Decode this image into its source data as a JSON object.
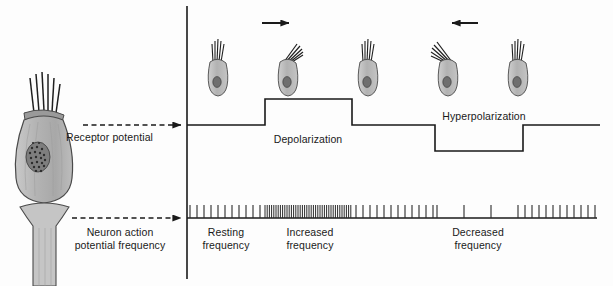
{
  "figure": {
    "type": "diagram",
    "width": 613,
    "height": 286,
    "background_color": "#fdfdfd",
    "line_color": "#1a1a1a"
  },
  "labels": {
    "receptor_potential": "Receptor potential",
    "neuron_action_line1": "Neuron action",
    "neuron_action_line2": "potential frequency",
    "depolarization": "Depolarization",
    "hyperpolarization": "Hyperpolarization",
    "resting_line1": "Resting",
    "resting_line2": "frequency",
    "increased_line1": "Increased",
    "increased_line2": "frequency",
    "decreased_line1": "Decreased",
    "decreased_line2": "frequency"
  },
  "icons": {
    "arrow_right": "arrow-right-icon",
    "arrow_left": "arrow-left-icon",
    "dashed_pointer_upper": "dashed-arrow-icon",
    "dashed_pointer_lower": "dashed-arrow-icon",
    "hair_cell": "hair-cell-icon",
    "sensory_neuron": "sensory-neuron-icon"
  },
  "hair_cells": [
    {
      "name": "hair-cell-upright-1",
      "bend": "none",
      "x": 218,
      "y": 62,
      "label": "upright"
    },
    {
      "name": "hair-cell-bent-right",
      "bend": "right",
      "x": 288,
      "y": 62,
      "label": "bent toward kinocilium"
    },
    {
      "name": "hair-cell-upright-2",
      "bend": "none",
      "x": 368,
      "y": 62,
      "label": "upright"
    },
    {
      "name": "hair-cell-bent-left",
      "bend": "left",
      "x": 448,
      "y": 62,
      "label": "bent away from kinocilium"
    },
    {
      "name": "hair-cell-upright-3",
      "bend": "none",
      "x": 518,
      "y": 62,
      "label": "upright"
    }
  ],
  "chart_data": {
    "type": "line",
    "title": "Receptor potential",
    "xlabel": "",
    "ylabel": "Receptor potential",
    "axis_origin_x": 187,
    "baseline_y": 125,
    "segments": [
      {
        "phase": "resting",
        "x_start": 187,
        "x_end": 265,
        "level": "baseline"
      },
      {
        "phase": "depolarization",
        "x_start": 265,
        "x_end": 352,
        "level": "above"
      },
      {
        "phase": "resting",
        "x_start": 352,
        "x_end": 435,
        "level": "baseline"
      },
      {
        "phase": "hyperpolarization",
        "x_start": 435,
        "x_end": 523,
        "level": "below"
      },
      {
        "phase": "resting",
        "x_start": 523,
        "x_end": 600,
        "level": "baseline"
      }
    ],
    "depolarization_amplitude_px": 26,
    "hyperpolarization_amplitude_px": 26
  },
  "spike_train": {
    "type": "raster",
    "baseline_y": 218,
    "x_start": 190,
    "x_end": 595,
    "tick_height": 13,
    "regions": [
      {
        "phase": "resting",
        "label": "Resting frequency",
        "x_start": 190,
        "x_end": 263,
        "interval_px": 7.0
      },
      {
        "phase": "increased",
        "label": "Increased frequency",
        "x_start": 265,
        "x_end": 352,
        "interval_px": 2.2
      },
      {
        "phase": "resting",
        "label": "",
        "x_start": 356,
        "x_end": 433,
        "interval_px": 7.0
      },
      {
        "phase": "decreased",
        "label": "Decreased frequency",
        "x_start": 437,
        "x_end": 521,
        "interval_px": 27.0
      },
      {
        "phase": "resting",
        "label": "",
        "x_start": 525,
        "x_end": 595,
        "interval_px": 7.0
      }
    ]
  },
  "colors": {
    "line": "#1a1a1a",
    "cell_body_fill": "#b9b9b9",
    "cell_body_stroke": "#555555",
    "nucleus": "#4d4d4d",
    "spike": "#2a2a2a"
  }
}
